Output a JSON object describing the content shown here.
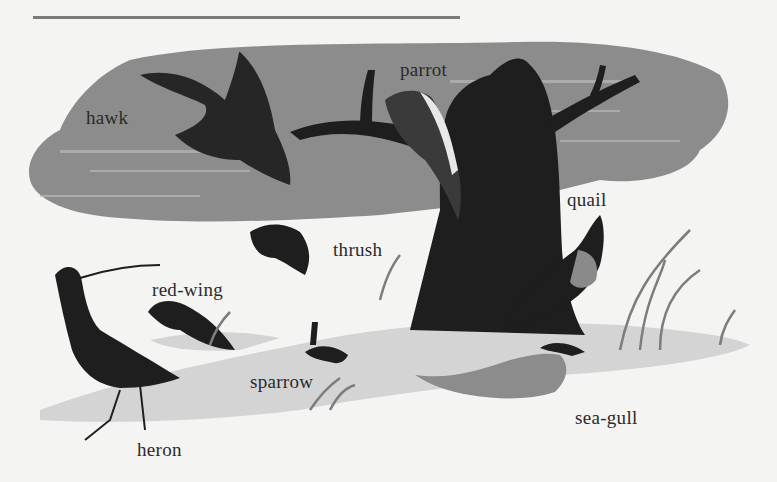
{
  "illustration": {
    "subject": "birds around a tree",
    "colors": {
      "background": "#f4f4f3",
      "sky_smudge": "#8c8c8c",
      "ground": "#d4d4d4",
      "ink": "#1e1e1e",
      "grass": "#7d7d7d",
      "rule": "#7a7a7a"
    },
    "labels": [
      {
        "id": "hawk",
        "text": "hawk",
        "x": 86,
        "y": 108
      },
      {
        "id": "parrot",
        "text": "parrot",
        "x": 400,
        "y": 60
      },
      {
        "id": "quail",
        "text": "quail",
        "x": 567,
        "y": 190
      },
      {
        "id": "thrush",
        "text": "thrush",
        "x": 333,
        "y": 240
      },
      {
        "id": "red-wing",
        "text": "red-wing",
        "x": 152,
        "y": 280
      },
      {
        "id": "sparrow",
        "text": "sparrow",
        "x": 250,
        "y": 372
      },
      {
        "id": "sea-gull",
        "text": "sea-gull",
        "x": 575,
        "y": 408
      },
      {
        "id": "heron",
        "text": "heron",
        "x": 137,
        "y": 440
      }
    ]
  }
}
